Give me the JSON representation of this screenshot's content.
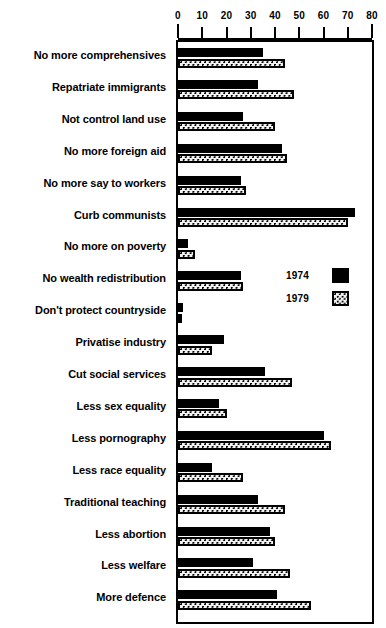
{
  "chart_data": {
    "type": "bar",
    "title": "",
    "subtitle": "",
    "xlabel": "",
    "ylabel": "",
    "orientation": "horizontal",
    "xlim": [
      0,
      80
    ],
    "xticks": [
      0,
      10,
      20,
      30,
      40,
      50,
      60,
      70,
      80
    ],
    "xtick_labels": [
      "0",
      "10",
      "20",
      "30",
      "40",
      "50",
      "60",
      "70",
      "80"
    ],
    "grid": false,
    "legend_position": "middle-right",
    "categories": [
      "No more comprehensives",
      "Repatriate immigrants",
      "Not control land use",
      "No more foreign aid",
      "No more say to workers",
      "Curb communists",
      "No more on poverty",
      "No wealth redistribution",
      "Don't protect countryside",
      "Privatise industry",
      "Cut social services",
      "Less sex equality",
      "Less pornography",
      "Less race equality",
      "Traditional teaching",
      "Less abortion",
      "Less welfare",
      "More defence"
    ],
    "series": [
      {
        "name": "1974",
        "color": "#000000",
        "fill": "solid-black",
        "values": [
          35,
          33,
          27,
          43,
          26,
          73,
          4,
          26,
          2,
          19,
          36,
          17,
          60,
          14,
          33,
          38,
          31,
          41
        ]
      },
      {
        "name": "1979",
        "color": "#f2f2f2",
        "fill": "dotted-stipple",
        "values": [
          44,
          48,
          40,
          45,
          28,
          70,
          7,
          27,
          1,
          14,
          47,
          20,
          63,
          27,
          44,
          40,
          46,
          55
        ]
      }
    ]
  },
  "legend": {
    "entries": [
      {
        "label": "1974",
        "swatch": "solid-black-swatch"
      },
      {
        "label": "1979",
        "swatch": "dotted-stipple-swatch"
      }
    ]
  }
}
